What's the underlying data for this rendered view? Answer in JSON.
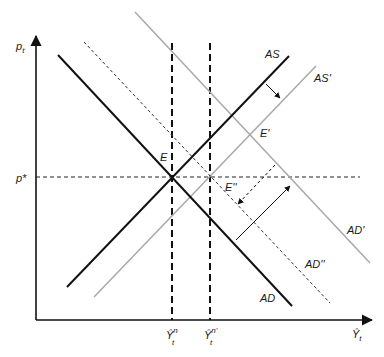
{
  "diagram": {
    "type": "AS-AD model",
    "axes": {
      "y_label": "p",
      "y_label_sub": "t",
      "x_label": "Ŷ",
      "x_label_sub": "t"
    },
    "price_level": {
      "label": "p*"
    },
    "output_ticks": [
      {
        "label": "Ŷ",
        "sub": "t",
        "sup": "n"
      },
      {
        "label": "Ŷ",
        "sub": "t",
        "sup": "n'"
      }
    ],
    "curves": [
      {
        "id": "AD",
        "label": "AD",
        "style": "solid",
        "color": "#111111"
      },
      {
        "id": "AS",
        "label": "AS",
        "style": "solid",
        "color": "#111111"
      },
      {
        "id": "AS_prime",
        "label": "AS'",
        "style": "solid",
        "color": "#a8a8a8"
      },
      {
        "id": "AD_prime",
        "label": "AD'",
        "style": "solid",
        "color": "#a8a8a8"
      },
      {
        "id": "AD_dprime",
        "label": "AD''",
        "style": "dashed",
        "color": "#333333"
      }
    ],
    "equilibria": [
      {
        "label": "E"
      },
      {
        "label": "E'"
      },
      {
        "label": "E''"
      }
    ],
    "colors": {
      "primary": "#111111",
      "shifted": "#a8a8a8",
      "axis": "#111111"
    }
  }
}
